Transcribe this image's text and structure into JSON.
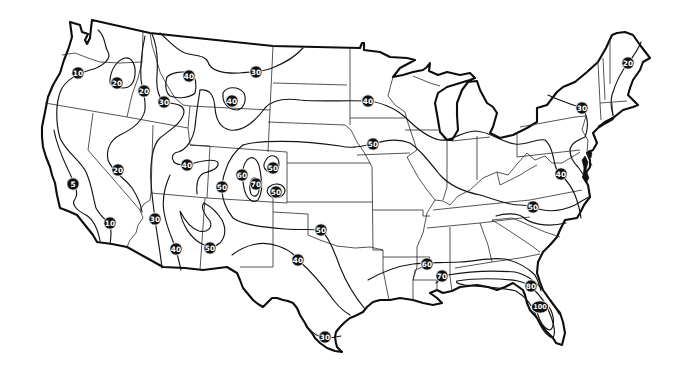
{
  "map": {
    "subject": "Contiguous United States isoline map",
    "line_style": "black isolines on white, values in black circular labels",
    "labels": [
      {
        "value": "10"
      },
      {
        "value": "20"
      },
      {
        "value": "20"
      },
      {
        "value": "30"
      },
      {
        "value": "40"
      },
      {
        "value": "30"
      },
      {
        "value": "40"
      },
      {
        "value": "40"
      },
      {
        "value": "50"
      },
      {
        "value": "20"
      },
      {
        "value": "40"
      },
      {
        "value": "5"
      },
      {
        "value": "50"
      },
      {
        "value": "60"
      },
      {
        "value": "70"
      },
      {
        "value": "50"
      },
      {
        "value": "50"
      },
      {
        "value": "10"
      },
      {
        "value": "30"
      },
      {
        "value": "40"
      },
      {
        "value": "50"
      },
      {
        "value": "50"
      },
      {
        "value": "40"
      },
      {
        "value": "30"
      },
      {
        "value": "60"
      },
      {
        "value": "70"
      },
      {
        "value": "80"
      },
      {
        "value": "100"
      },
      {
        "value": "50"
      },
      {
        "value": "40"
      },
      {
        "value": "30"
      },
      {
        "value": "20"
      }
    ],
    "value_range": {
      "min": "5",
      "max": "100"
    },
    "colors": {
      "land": "#ffffff",
      "lines": "#111111",
      "label_fill": "#111111",
      "label_text": "#ffffff"
    }
  }
}
